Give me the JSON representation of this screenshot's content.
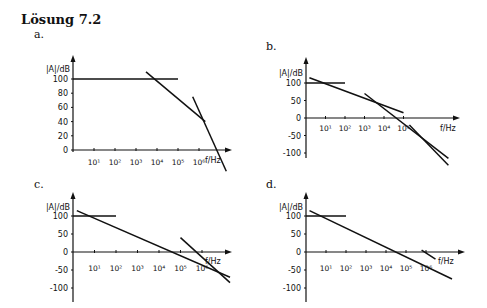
{
  "heading": "Lösung 7.2",
  "panels": [
    {
      "id": "a",
      "label": "a.",
      "label_pos": [
        34,
        28
      ]
    },
    {
      "id": "b",
      "label": "b.",
      "label_pos": [
        266,
        40
      ]
    },
    {
      "id": "c",
      "label": "c.",
      "label_pos": [
        34,
        178
      ]
    },
    {
      "id": "d",
      "label": "d.",
      "label_pos": [
        266,
        178
      ]
    }
  ],
  "chart_data": [
    {
      "panel": "a",
      "type": "line",
      "title": "a.",
      "ylabel": "|A|/dB",
      "xlabel": "f/Hz",
      "xscale": "log",
      "xticks": [
        "10¹",
        "10²",
        "10³",
        "10⁴",
        "10⁵",
        "10⁶"
      ],
      "yticks": [
        0,
        20,
        40,
        60,
        80,
        100
      ],
      "ylim": [
        0,
        110
      ],
      "series": [
        {
          "name": "flat asymptote",
          "x": [
            1,
            100000
          ],
          "y": [
            100,
            100
          ]
        },
        {
          "name": "slope -20 dB/dec",
          "x": [
            3000,
            2000000
          ],
          "y": [
            110,
            40
          ]
        },
        {
          "name": "slope -40 dB/dec",
          "x": [
            500000,
            20000000
          ],
          "y": [
            75,
            -30
          ]
        }
      ]
    },
    {
      "panel": "b",
      "type": "line",
      "title": "b.",
      "ylabel": "|A|/dB",
      "xlabel": "f/Hz",
      "xscale": "log",
      "xticks": [
        "10¹",
        "10²",
        "10³",
        "10⁴",
        "10⁵"
      ],
      "yticks": [
        100,
        50,
        0,
        -50,
        -100
      ],
      "ylim": [
        -120,
        110
      ],
      "series": [
        {
          "name": "flat asymptote",
          "x": [
            1,
            100
          ],
          "y": [
            100,
            100
          ]
        },
        {
          "name": "slope -20 dB/dec",
          "x": [
            1.5,
            100000
          ],
          "y": [
            115,
            15
          ]
        },
        {
          "name": "slope -40 dB/dec",
          "x": [
            1000,
            20000000
          ],
          "y": [
            70,
            -115
          ]
        },
        {
          "name": "slope -60 dB/dec",
          "x": [
            200000,
            20000000
          ],
          "y": [
            -20,
            -135
          ]
        }
      ]
    },
    {
      "panel": "c",
      "type": "line",
      "title": "c.",
      "ylabel": "|A|/dB",
      "xlabel": "f/Hz",
      "xscale": "log",
      "xticks": [
        "10¹",
        "10²",
        "10³",
        "10⁴",
        "10⁵",
        "10⁶"
      ],
      "yticks": [
        100,
        50,
        0,
        -50,
        -100
      ],
      "ylim": [
        -120,
        110
      ],
      "series": [
        {
          "name": "flat asymptote",
          "x": [
            1,
            100
          ],
          "y": [
            100,
            100
          ]
        },
        {
          "name": "slope -20 dB/dec",
          "x": [
            1.5,
            20000000
          ],
          "y": [
            115,
            -70
          ]
        },
        {
          "name": "slope -40 dB/dec",
          "x": [
            100000,
            20000000
          ],
          "y": [
            40,
            -85
          ]
        }
      ]
    },
    {
      "panel": "d",
      "type": "line",
      "title": "d.",
      "ylabel": "|A|/dB",
      "xlabel": "f/Hz",
      "xscale": "log",
      "xticks": [
        "10¹",
        "10²",
        "10³",
        "10⁴",
        "10⁵",
        "10⁶"
      ],
      "yticks": [
        100,
        50,
        0,
        -50,
        -100
      ],
      "ylim": [
        -120,
        110
      ],
      "series": [
        {
          "name": "flat asymptote",
          "x": [
            1,
            100
          ],
          "y": [
            100,
            100
          ]
        },
        {
          "name": "slope -20 dB/dec",
          "x": [
            1.5,
            20000000
          ],
          "y": [
            115,
            -75
          ]
        },
        {
          "name": "slope -40 dB/dec",
          "x": [
            600000,
            3000000
          ],
          "y": [
            5,
            -20
          ]
        }
      ]
    }
  ]
}
